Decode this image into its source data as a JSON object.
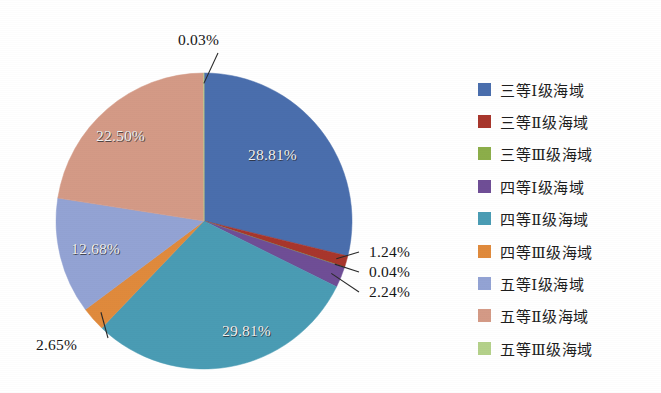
{
  "chart_data": {
    "type": "pie",
    "title": "",
    "subtitle": "",
    "xlabel": "",
    "ylabel": "",
    "legend_position": "right",
    "grid": false,
    "start_angle_deg": 0,
    "direction": "clockwise",
    "categories": [
      "三等Ⅰ级海域",
      "三等Ⅱ级海域",
      "三等Ⅲ级海域",
      "四等Ⅰ级海域",
      "四等Ⅱ级海域",
      "四等Ⅲ级海域",
      "五等Ⅰ级海域",
      "五等Ⅱ级海域",
      "五等Ⅲ级海域"
    ],
    "values": [
      28.81,
      1.24,
      0.04,
      2.24,
      29.81,
      2.65,
      12.68,
      22.5,
      0.03
    ],
    "value_labels": [
      "28.81%",
      "1.24%",
      "0.04%",
      "2.24%",
      "29.81%",
      "2.65%",
      "12.68%",
      "22.50%",
      "0.03%"
    ],
    "colors": [
      "#4a6ead",
      "#a8362c",
      "#8cae4a",
      "#6f4e96",
      "#4a9cb4",
      "#e08a3c",
      "#93a3d4",
      "#d49a86",
      "#b4d18a"
    ],
    "unit": "percent"
  },
  "pie": {
    "center_x": 204,
    "center_y": 221,
    "radius": 148,
    "slices": [
      {
        "name": "三等Ⅰ级海域",
        "value": 28.81,
        "label": "28.81%",
        "color": "#4a6ead",
        "label_placement": "inside",
        "label_x": 248,
        "label_y": 146
      },
      {
        "name": "三等Ⅱ级海域",
        "value": 1.24,
        "label": "1.24%",
        "color": "#a8362c",
        "label_placement": "outside",
        "label_x": 369,
        "label_y": 243
      },
      {
        "name": "三等Ⅲ级海域",
        "value": 0.04,
        "label": "0.04%",
        "color": "#8cae4a",
        "label_placement": "outside",
        "label_x": 369,
        "label_y": 263
      },
      {
        "name": "四等Ⅰ级海域",
        "value": 2.24,
        "label": "2.24%",
        "color": "#6f4e96",
        "label_placement": "outside",
        "label_x": 369,
        "label_y": 283
      },
      {
        "name": "四等Ⅱ级海域",
        "value": 29.81,
        "label": "29.81%",
        "color": "#4a9cb4",
        "label_placement": "inside",
        "label_x": 222,
        "label_y": 322
      },
      {
        "name": "四等Ⅲ级海域",
        "value": 2.65,
        "label": "2.65%",
        "color": "#e08a3c",
        "label_placement": "outside",
        "label_x": 36,
        "label_y": 336
      },
      {
        "name": "五等Ⅰ级海域",
        "value": 12.68,
        "label": "12.68%",
        "color": "#93a3d4",
        "label_placement": "inside",
        "label_x": 71,
        "label_y": 240
      },
      {
        "name": "五等Ⅱ级海域",
        "value": 22.5,
        "label": "22.50%",
        "color": "#d49a86",
        "label_placement": "inside",
        "label_x": 96,
        "label_y": 127
      },
      {
        "name": "五等Ⅲ级海域",
        "value": 0.03,
        "label": "0.03%",
        "color": "#b4d18a",
        "label_placement": "outside",
        "label_x": 178,
        "label_y": 31
      }
    ]
  },
  "legend": {
    "items": [
      {
        "label": "三等Ⅰ级海域",
        "color": "#4a6ead"
      },
      {
        "label": "三等Ⅱ级海域",
        "color": "#a8362c"
      },
      {
        "label": "三等Ⅲ级海域",
        "color": "#8cae4a"
      },
      {
        "label": "四等Ⅰ级海域",
        "color": "#6f4e96"
      },
      {
        "label": "四等Ⅱ级海域",
        "color": "#4a9cb4"
      },
      {
        "label": "四等Ⅲ级海域",
        "color": "#e08a3c"
      },
      {
        "label": "五等Ⅰ级海域",
        "color": "#93a3d4"
      },
      {
        "label": "五等Ⅱ级海域",
        "color": "#d49a86"
      },
      {
        "label": "五等Ⅲ级海域",
        "color": "#b4d18a"
      }
    ]
  }
}
